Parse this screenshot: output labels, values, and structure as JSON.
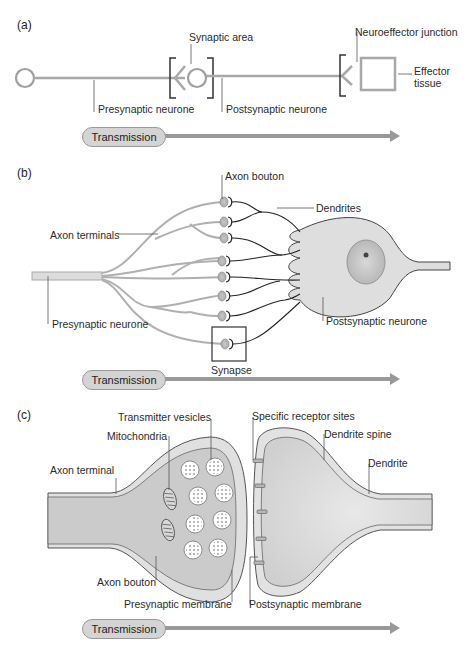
{
  "panels": {
    "a": {
      "letter": "(a)",
      "labels": {
        "synaptic_area": "Synaptic area",
        "neuroeffector_junction": "Neuroeffector junction",
        "presynaptic_neurone": "Presynaptic neurone",
        "postsynaptic_neurone": "Postsynaptic neurone",
        "effector_tissue_1": "Effector",
        "effector_tissue_2": "tissue"
      },
      "transmission": "Transmission"
    },
    "b": {
      "letter": "(b)",
      "labels": {
        "axon_bouton": "Axon bouton",
        "dendrites": "Dendrites",
        "axon_terminals": "Axon terminals",
        "presynaptic_neurone": "Presynaptic neurone",
        "postsynaptic_neurone": "Postsynaptic neurone",
        "synapse": "Synapse"
      },
      "transmission": "Transmission"
    },
    "c": {
      "letter": "(c)",
      "labels": {
        "transmitter_vesicles": "Transmitter vesicles",
        "mitochondria": "Mitochondria",
        "axon_terminal": "Axon terminal",
        "axon_bouton": "Axon bouton",
        "presynaptic_membrane": "Presynaptic membrane",
        "specific_receptor_sites": "Specific receptor sites",
        "dendrite_spine": "Dendrite spine",
        "dendrite": "Dendrite",
        "postsynaptic_membrane": "Postsynaptic membrane"
      },
      "transmission": "Transmission"
    }
  },
  "colors": {
    "neuron_line": "#a8a8a8",
    "fill_light": "#e2e2e2",
    "fill_mid": "#cfcfcf",
    "outline_dark": "#333333",
    "arrow": "#999999"
  }
}
